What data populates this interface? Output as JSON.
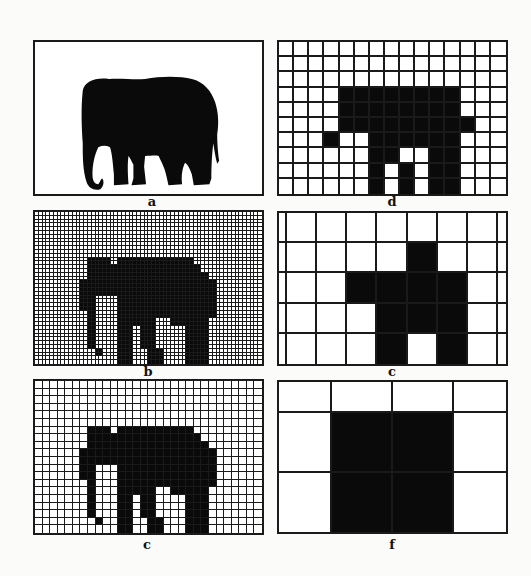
{
  "figure": {
    "panels": [
      {
        "id": "a",
        "label": "a",
        "type": "silhouette"
      },
      {
        "id": "b",
        "label": "b",
        "type": "grid",
        "cols": 60,
        "rows": 40
      },
      {
        "id": "c",
        "label": "c",
        "type": "grid",
        "cols": 30,
        "rows": 20
      },
      {
        "id": "d",
        "label": "d",
        "type": "grid",
        "cols": 15,
        "rows": 10
      },
      {
        "id": "e",
        "label": "c",
        "type": "grid",
        "cols": 7,
        "rows": 5
      },
      {
        "id": "f",
        "label": "f",
        "type": "grid",
        "cols": 4,
        "rows": 3
      }
    ]
  },
  "bitmaps": {
    "c_runs": [
      [],
      [],
      [],
      [],
      [],
      [],
      [
        [
          7,
          9
        ],
        [
          11,
          20
        ]
      ],
      [
        [
          7,
          21
        ]
      ],
      [
        [
          7,
          22
        ]
      ],
      [
        [
          6,
          23
        ]
      ],
      [
        [
          6,
          23
        ]
      ],
      [
        [
          6,
          7
        ],
        [
          11,
          23
        ]
      ],
      [
        [
          6,
          7
        ],
        [
          11,
          23
        ]
      ],
      [
        [
          7,
          7
        ],
        [
          11,
          23
        ]
      ],
      [
        [
          7,
          7
        ],
        [
          11,
          15
        ],
        [
          18,
          22
        ]
      ],
      [
        [
          7,
          7
        ],
        [
          11,
          12
        ],
        [
          14,
          15
        ],
        [
          20,
          22
        ]
      ],
      [
        [
          7,
          7
        ],
        [
          11,
          12
        ],
        [
          14,
          15
        ],
        [
          20,
          22
        ]
      ],
      [
        [
          7,
          7
        ],
        [
          11,
          12
        ],
        [
          14,
          15
        ],
        [
          20,
          22
        ]
      ],
      [
        [
          8,
          8
        ],
        [
          11,
          12
        ],
        [
          15,
          16
        ],
        [
          20,
          22
        ]
      ],
      [
        [
          11,
          12
        ],
        [
          15,
          16
        ],
        [
          20,
          22
        ]
      ]
    ],
    "d": [
      "...............",
      "...............",
      "...............",
      "....########...",
      "....########...",
      "....#########..",
      "...#..######...",
      "......##..##...",
      "......#.#.##...",
      "......#.#.##..."
    ],
    "e": [
      ".......",
      "....#..",
      "..####.",
      "...###.",
      "...#.#."
    ],
    "f": [
      "....",
      ".##.",
      ".##."
    ]
  }
}
